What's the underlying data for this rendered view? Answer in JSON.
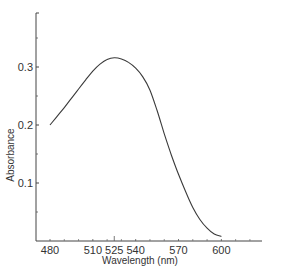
{
  "chart_data": {
    "type": "line",
    "title": "",
    "xlabel": "Wavelength (nm)",
    "ylabel": "Absorbance",
    "xlim": [
      470,
      640
    ],
    "ylim": [
      0,
      0.39
    ],
    "grid": false,
    "legend": null,
    "x_ticks": [
      480,
      510,
      525,
      540,
      570,
      600
    ],
    "y_ticks": [
      0.1,
      0.2,
      0.3
    ],
    "y_minor_ticks": [
      0.05,
      0.15,
      0.25,
      0.35
    ],
    "series": [
      {
        "name": "Absorbance spectrum",
        "x": [
          480,
          485,
          490,
          495,
          500,
          505,
          510,
          515,
          520,
          525,
          530,
          535,
          540,
          545,
          550,
          555,
          560,
          565,
          570,
          575,
          580,
          585,
          590,
          595,
          600
        ],
        "y": [
          0.2,
          0.215,
          0.23,
          0.246,
          0.262,
          0.278,
          0.293,
          0.305,
          0.313,
          0.316,
          0.314,
          0.308,
          0.298,
          0.283,
          0.26,
          0.225,
          0.185,
          0.148,
          0.115,
          0.085,
          0.058,
          0.037,
          0.022,
          0.012,
          0.008
        ]
      }
    ]
  },
  "labels": {
    "xlabel": "Wavelength (nm)",
    "ylabel": "Absorbance",
    "x_ticks": [
      "480",
      "510",
      "525",
      "540",
      "570",
      "600"
    ],
    "y_ticks": [
      "0.1",
      "0.2",
      "0.3"
    ]
  }
}
